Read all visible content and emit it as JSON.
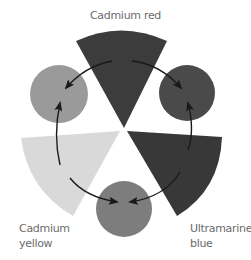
{
  "diagram": {
    "title": "",
    "labels": {
      "top": "Cadmium red",
      "left_line1": "Cadmium",
      "left_line2": "yellow",
      "right_line1": "Ultramarine",
      "right_line2": "blue"
    },
    "primaries": [
      {
        "name": "Cadmium red",
        "position": "top",
        "shape": "wedge",
        "color": "#3c3c3c"
      },
      {
        "name": "Cadmium yellow",
        "position": "bottom-left",
        "shape": "wedge",
        "color": "#d9d9d9"
      },
      {
        "name": "Ultramarine blue",
        "position": "bottom-right",
        "shape": "wedge",
        "color": "#383838"
      }
    ],
    "mixtures": [
      {
        "position": "left",
        "between": [
          "Cadmium red",
          "Cadmium yellow"
        ],
        "shape": "circle",
        "color": "#9a9a9a"
      },
      {
        "position": "right",
        "between": [
          "Cadmium red",
          "Ultramarine blue"
        ],
        "shape": "circle",
        "color": "#4a4a4a"
      },
      {
        "position": "bottom",
        "between": [
          "Cadmium yellow",
          "Ultramarine blue"
        ],
        "shape": "circle",
        "color": "#7d7d7d"
      }
    ],
    "arrow_color": "#1a1a1a"
  }
}
